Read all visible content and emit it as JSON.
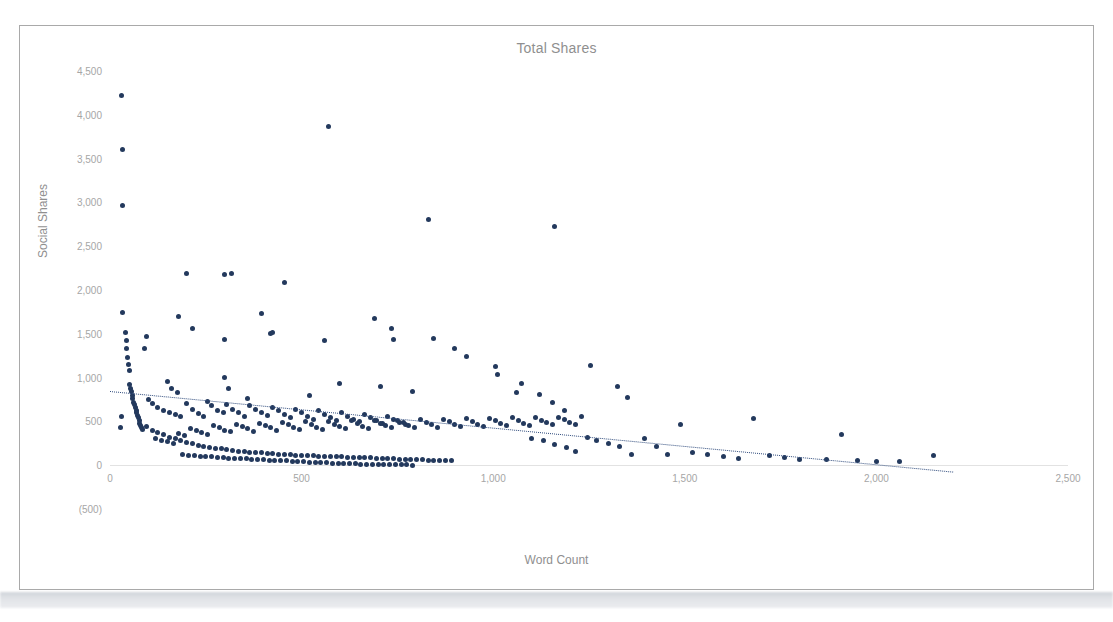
{
  "chart_data": {
    "type": "scatter",
    "title": "Total Shares",
    "xlabel": "Word Count",
    "ylabel": "Social Shares",
    "xlim": [
      0,
      2500
    ],
    "ylim": [
      -500,
      4500
    ],
    "xticks": [
      "0",
      "500",
      "1,000",
      "1,500",
      "2,000",
      "2,500"
    ],
    "xtick_values": [
      0,
      500,
      1000,
      1500,
      2000,
      2500
    ],
    "yticks": [
      "4,500",
      "4,000",
      "3,500",
      "3,000",
      "2,500",
      "2,000",
      "1,500",
      "1,000",
      "500",
      "0",
      "(500)"
    ],
    "ytick_values": [
      4500,
      4000,
      3500,
      3000,
      2500,
      2000,
      1500,
      1000,
      500,
      0,
      -500
    ],
    "grid": false,
    "legend": "none",
    "marker_color": "#23395d",
    "trendline": {
      "type": "linear",
      "style": "dotted",
      "color": "#2f4b7c",
      "x_start": 0,
      "y_start": 850,
      "x_end": 2200,
      "y_end": -70
    },
    "points": [
      [
        30,
        4220
      ],
      [
        32,
        3600
      ],
      [
        33,
        2960
      ],
      [
        570,
        3870
      ],
      [
        830,
        2810
      ],
      [
        1160,
        2720
      ],
      [
        200,
        2190
      ],
      [
        300,
        2180
      ],
      [
        318,
        2190
      ],
      [
        455,
        2080
      ],
      [
        33,
        1740
      ],
      [
        180,
        1700
      ],
      [
        215,
        1560
      ],
      [
        690,
        1680
      ],
      [
        300,
        1430
      ],
      [
        395,
        1730
      ],
      [
        420,
        1500
      ],
      [
        425,
        1510
      ],
      [
        560,
        1420
      ],
      [
        735,
        1560
      ],
      [
        740,
        1430
      ],
      [
        845,
        1450
      ],
      [
        95,
        1470
      ],
      [
        90,
        1330
      ],
      [
        40,
        1520
      ],
      [
        42,
        1420
      ],
      [
        44,
        1330
      ],
      [
        46,
        1230
      ],
      [
        48,
        1150
      ],
      [
        50,
        1080
      ],
      [
        900,
        1330
      ],
      [
        930,
        1240
      ],
      [
        1005,
        1130
      ],
      [
        1010,
        1035
      ],
      [
        1075,
        935
      ],
      [
        150,
        960
      ],
      [
        160,
        880
      ],
      [
        175,
        830
      ],
      [
        300,
        1000
      ],
      [
        310,
        880
      ],
      [
        360,
        760
      ],
      [
        520,
        790
      ],
      [
        600,
        930
      ],
      [
        705,
        900
      ],
      [
        790,
        840
      ],
      [
        1060,
        830
      ],
      [
        1120,
        810
      ],
      [
        1155,
        715
      ],
      [
        1185,
        620
      ],
      [
        1255,
        1135
      ],
      [
        1325,
        900
      ],
      [
        1350,
        775
      ],
      [
        52,
        920
      ],
      [
        54,
        880
      ],
      [
        56,
        840
      ],
      [
        58,
        800
      ],
      [
        60,
        760
      ],
      [
        62,
        720
      ],
      [
        64,
        690
      ],
      [
        66,
        660
      ],
      [
        68,
        630
      ],
      [
        70,
        600
      ],
      [
        72,
        570
      ],
      [
        74,
        540
      ],
      [
        76,
        510
      ],
      [
        78,
        480
      ],
      [
        80,
        450
      ],
      [
        82,
        430
      ],
      [
        84,
        410
      ],
      [
        30,
        560
      ],
      [
        28,
        430
      ],
      [
        100,
        745
      ],
      [
        112,
        700
      ],
      [
        125,
        660
      ],
      [
        140,
        620
      ],
      [
        155,
        600
      ],
      [
        170,
        575
      ],
      [
        185,
        555
      ],
      [
        200,
        700
      ],
      [
        215,
        640
      ],
      [
        230,
        590
      ],
      [
        245,
        560
      ],
      [
        255,
        730
      ],
      [
        265,
        680
      ],
      [
        280,
        630
      ],
      [
        295,
        600
      ],
      [
        305,
        690
      ],
      [
        320,
        640
      ],
      [
        335,
        600
      ],
      [
        350,
        560
      ],
      [
        365,
        680
      ],
      [
        380,
        640
      ],
      [
        395,
        600
      ],
      [
        410,
        570
      ],
      [
        425,
        660
      ],
      [
        440,
        620
      ],
      [
        455,
        580
      ],
      [
        470,
        545
      ],
      [
        485,
        640
      ],
      [
        500,
        600
      ],
      [
        515,
        560
      ],
      [
        530,
        525
      ],
      [
        545,
        620
      ],
      [
        560,
        580
      ],
      [
        575,
        545
      ],
      [
        590,
        510
      ],
      [
        605,
        600
      ],
      [
        620,
        560
      ],
      [
        635,
        525
      ],
      [
        650,
        495
      ],
      [
        665,
        575
      ],
      [
        680,
        540
      ],
      [
        695,
        505
      ],
      [
        710,
        480
      ],
      [
        725,
        555
      ],
      [
        740,
        520
      ],
      [
        755,
        490
      ],
      [
        770,
        460
      ],
      [
        95,
        440
      ],
      [
        110,
        400
      ],
      [
        125,
        370
      ],
      [
        140,
        345
      ],
      [
        155,
        320
      ],
      [
        170,
        300
      ],
      [
        185,
        280
      ],
      [
        200,
        260
      ],
      [
        215,
        245
      ],
      [
        230,
        230
      ],
      [
        245,
        215
      ],
      [
        260,
        205
      ],
      [
        275,
        195
      ],
      [
        290,
        185
      ],
      [
        305,
        175
      ],
      [
        320,
        170
      ],
      [
        335,
        160
      ],
      [
        350,
        155
      ],
      [
        365,
        150
      ],
      [
        380,
        145
      ],
      [
        395,
        140
      ],
      [
        410,
        135
      ],
      [
        425,
        130
      ],
      [
        440,
        125
      ],
      [
        455,
        120
      ],
      [
        470,
        118
      ],
      [
        485,
        115
      ],
      [
        500,
        112
      ],
      [
        515,
        110
      ],
      [
        530,
        108
      ],
      [
        545,
        105
      ],
      [
        560,
        103
      ],
      [
        575,
        100
      ],
      [
        590,
        98
      ],
      [
        605,
        95
      ],
      [
        620,
        93
      ],
      [
        635,
        90
      ],
      [
        650,
        88
      ],
      [
        665,
        85
      ],
      [
        680,
        83
      ],
      [
        695,
        80
      ],
      [
        710,
        78
      ],
      [
        725,
        75
      ],
      [
        740,
        73
      ],
      [
        755,
        70
      ],
      [
        770,
        68
      ],
      [
        785,
        65
      ],
      [
        800,
        63
      ],
      [
        815,
        60
      ],
      [
        830,
        58
      ],
      [
        845,
        55
      ],
      [
        860,
        53
      ],
      [
        875,
        50
      ],
      [
        890,
        48
      ],
      [
        120,
        310
      ],
      [
        135,
        285
      ],
      [
        150,
        265
      ],
      [
        165,
        250
      ],
      [
        180,
        360
      ],
      [
        195,
        335
      ],
      [
        210,
        420
      ],
      [
        225,
        395
      ],
      [
        240,
        370
      ],
      [
        255,
        350
      ],
      [
        270,
        450
      ],
      [
        285,
        425
      ],
      [
        300,
        400
      ],
      [
        315,
        380
      ],
      [
        330,
        470
      ],
      [
        345,
        440
      ],
      [
        360,
        415
      ],
      [
        375,
        390
      ],
      [
        390,
        480
      ],
      [
        405,
        450
      ],
      [
        420,
        425
      ],
      [
        435,
        400
      ],
      [
        450,
        490
      ],
      [
        465,
        460
      ],
      [
        480,
        430
      ],
      [
        495,
        405
      ],
      [
        510,
        495
      ],
      [
        525,
        465
      ],
      [
        540,
        435
      ],
      [
        555,
        410
      ],
      [
        570,
        500
      ],
      [
        585,
        470
      ],
      [
        600,
        440
      ],
      [
        615,
        415
      ],
      [
        630,
        505
      ],
      [
        645,
        475
      ],
      [
        660,
        445
      ],
      [
        675,
        420
      ],
      [
        690,
        510
      ],
      [
        705,
        480
      ],
      [
        720,
        450
      ],
      [
        735,
        425
      ],
      [
        750,
        515
      ],
      [
        765,
        485
      ],
      [
        780,
        455
      ],
      [
        795,
        430
      ],
      [
        810,
        520
      ],
      [
        825,
        490
      ],
      [
        840,
        460
      ],
      [
        855,
        435
      ],
      [
        870,
        525
      ],
      [
        885,
        495
      ],
      [
        900,
        465
      ],
      [
        915,
        440
      ],
      [
        930,
        530
      ],
      [
        945,
        500
      ],
      [
        960,
        470
      ],
      [
        975,
        445
      ],
      [
        990,
        535
      ],
      [
        1005,
        505
      ],
      [
        1020,
        475
      ],
      [
        1035,
        450
      ],
      [
        1050,
        540
      ],
      [
        1065,
        510
      ],
      [
        1080,
        480
      ],
      [
        1095,
        455
      ],
      [
        1110,
        545
      ],
      [
        1125,
        515
      ],
      [
        1140,
        485
      ],
      [
        1155,
        460
      ],
      [
        1170,
        550
      ],
      [
        1185,
        520
      ],
      [
        1200,
        490
      ],
      [
        1215,
        465
      ],
      [
        1230,
        555
      ],
      [
        190,
        120
      ],
      [
        205,
        115
      ],
      [
        220,
        110
      ],
      [
        235,
        105
      ],
      [
        250,
        100
      ],
      [
        265,
        95
      ],
      [
        280,
        90
      ],
      [
        295,
        85
      ],
      [
        310,
        82
      ],
      [
        325,
        78
      ],
      [
        340,
        75
      ],
      [
        355,
        72
      ],
      [
        370,
        68
      ],
      [
        385,
        65
      ],
      [
        400,
        62
      ],
      [
        415,
        58
      ],
      [
        430,
        55
      ],
      [
        445,
        52
      ],
      [
        460,
        48
      ],
      [
        475,
        45
      ],
      [
        490,
        42
      ],
      [
        505,
        38
      ],
      [
        520,
        35
      ],
      [
        535,
        32
      ],
      [
        550,
        30
      ],
      [
        565,
        28
      ],
      [
        580,
        25
      ],
      [
        595,
        22
      ],
      [
        610,
        20
      ],
      [
        625,
        18
      ],
      [
        640,
        15
      ],
      [
        655,
        13
      ],
      [
        670,
        12
      ],
      [
        685,
        10
      ],
      [
        700,
        8
      ],
      [
        715,
        7
      ],
      [
        730,
        6
      ],
      [
        745,
        5
      ],
      [
        760,
        4
      ],
      [
        775,
        3
      ],
      [
        790,
        2
      ],
      [
        1100,
        300
      ],
      [
        1130,
        280
      ],
      [
        1160,
        240
      ],
      [
        1190,
        200
      ],
      [
        1215,
        160
      ],
      [
        1245,
        320
      ],
      [
        1270,
        280
      ],
      [
        1300,
        250
      ],
      [
        1330,
        210
      ],
      [
        1360,
        120
      ],
      [
        1395,
        300
      ],
      [
        1425,
        210
      ],
      [
        1455,
        120
      ],
      [
        1490,
        460
      ],
      [
        1520,
        150
      ],
      [
        1560,
        120
      ],
      [
        1600,
        100
      ],
      [
        1640,
        80
      ],
      [
        1680,
        530
      ],
      [
        1720,
        110
      ],
      [
        1760,
        90
      ],
      [
        1800,
        70
      ],
      [
        1870,
        60
      ],
      [
        1910,
        350
      ],
      [
        1950,
        55
      ],
      [
        2000,
        45
      ],
      [
        2060,
        40
      ],
      [
        2150,
        110
      ]
    ]
  },
  "artifacts": {
    "caption_text": ""
  }
}
